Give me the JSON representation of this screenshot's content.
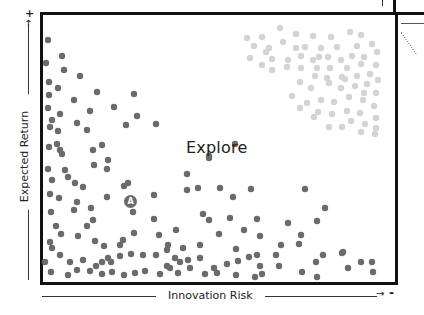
{
  "chart_data": {
    "type": "scatter",
    "title": "",
    "xlabel": "Innovation Risk",
    "ylabel": "Expected Return",
    "x_axis_end_symbol": "-",
    "y_axis_end_symbol": "+",
    "annotation": "Explore",
    "marker_label": "A",
    "grid": false,
    "colors": {
      "primary_dots": "#6b6b6b",
      "faded_dots": "#d4d4d4",
      "frame": "#111111",
      "text": "#222222"
    },
    "series": [
      {
        "name": "primary",
        "points": [
          [
            48,
            40
          ],
          [
            62,
            56
          ],
          [
            46,
            63
          ],
          [
            64,
            70
          ],
          [
            80,
            76
          ],
          [
            49,
            82
          ],
          [
            58,
            88
          ],
          [
            97,
            92
          ],
          [
            49,
            95
          ],
          [
            74,
            100
          ],
          [
            134,
            94
          ],
          [
            48,
            108
          ],
          [
            60,
            114
          ],
          [
            90,
            111
          ],
          [
            114,
            107
          ],
          [
            137,
            116
          ],
          [
            52,
            120
          ],
          [
            77,
            123
          ],
          [
            50,
            127
          ],
          [
            58,
            131
          ],
          [
            87,
            130
          ],
          [
            57,
            144
          ],
          [
            60,
            150
          ],
          [
            102,
            145
          ],
          [
            126,
            125
          ],
          [
            156,
            124
          ],
          [
            49,
            147
          ],
          [
            62,
            154
          ],
          [
            93,
            150
          ],
          [
            108,
            160
          ],
          [
            48,
            169
          ],
          [
            65,
            170
          ],
          [
            94,
            165
          ],
          [
            107,
            169
          ],
          [
            128,
            183
          ],
          [
            68,
            177
          ],
          [
            52,
            180
          ],
          [
            75,
            183
          ],
          [
            83,
            187
          ],
          [
            50,
            194
          ],
          [
            124,
            186
          ],
          [
            154,
            195
          ],
          [
            107,
            197
          ],
          [
            59,
            198
          ],
          [
            77,
            202
          ],
          [
            74,
            210
          ],
          [
            91,
            208
          ],
          [
            51,
            212
          ],
          [
            133,
            212
          ],
          [
            154,
            219
          ],
          [
            56,
            226
          ],
          [
            93,
            220
          ],
          [
            61,
            234
          ],
          [
            78,
            236
          ],
          [
            87,
            226
          ],
          [
            50,
            242
          ],
          [
            95,
            241
          ],
          [
            52,
            248
          ],
          [
            123,
            240
          ],
          [
            134,
            233
          ],
          [
            120,
            245
          ],
          [
            104,
            246
          ],
          [
            159,
            235
          ],
          [
            176,
            230
          ],
          [
            187,
            174
          ],
          [
            209,
            158
          ],
          [
            235,
            144
          ],
          [
            251,
            189
          ],
          [
            187,
            190
          ],
          [
            198,
            188
          ],
          [
            220,
            188
          ],
          [
            233,
            197
          ],
          [
            203,
            214
          ],
          [
            209,
            220
          ],
          [
            230,
            218
          ],
          [
            257,
            219
          ],
          [
            209,
            156
          ],
          [
            219,
            234
          ],
          [
            244,
            230
          ],
          [
            260,
            236
          ],
          [
            168,
            245
          ],
          [
            183,
            248
          ],
          [
            200,
            245
          ],
          [
            156,
            255
          ],
          [
            167,
            250
          ],
          [
            175,
            258
          ],
          [
            143,
            255
          ],
          [
            131,
            254
          ],
          [
            120,
            256
          ],
          [
            108,
            258
          ],
          [
            102,
            262
          ],
          [
            60,
            255
          ],
          [
            70,
            262
          ],
          [
            83,
            260
          ],
          [
            96,
            266
          ],
          [
            111,
            262
          ],
          [
            45,
            262
          ],
          [
            51,
            272
          ],
          [
            68,
            275
          ],
          [
            77,
            270
          ],
          [
            90,
            271
          ],
          [
            102,
            274
          ],
          [
            112,
            272
          ],
          [
            124,
            275
          ],
          [
            135,
            273
          ],
          [
            145,
            271
          ],
          [
            160,
            274
          ],
          [
            170,
            268
          ],
          [
            180,
            262
          ],
          [
            188,
            260
          ],
          [
            200,
            258
          ],
          [
            214,
            268
          ],
          [
            227,
            264
          ],
          [
            238,
            261
          ],
          [
            249,
            257
          ],
          [
            262,
            274
          ],
          [
            217,
            273
          ],
          [
            205,
            274
          ],
          [
            190,
            268
          ],
          [
            178,
            273
          ],
          [
            167,
            266
          ],
          [
            305,
            189
          ],
          [
            317,
            221
          ],
          [
            301,
            235
          ],
          [
            299,
            244
          ],
          [
            323,
            255
          ],
          [
            316,
            262
          ],
          [
            343,
            252
          ],
          [
            361,
            262
          ],
          [
            302,
            272
          ],
          [
            317,
            277
          ],
          [
            348,
            268
          ],
          [
            372,
            262
          ],
          [
            373,
            272
          ],
          [
            276,
            255
          ],
          [
            279,
            266
          ],
          [
            281,
            245
          ],
          [
            260,
            266
          ],
          [
            255,
            277
          ],
          [
            236,
            275
          ],
          [
            236,
            249
          ],
          [
            342,
            253
          ],
          [
            288,
            223
          ],
          [
            325,
            208
          ],
          [
            257,
            255
          ]
        ]
      },
      {
        "name": "faded",
        "points": [
          [
            280,
            28
          ],
          [
            296,
            34
          ],
          [
            247,
            38
          ],
          [
            262,
            37
          ],
          [
            313,
            36
          ],
          [
            331,
            37
          ],
          [
            350,
            32
          ],
          [
            361,
            35
          ],
          [
            321,
            48
          ],
          [
            337,
            47
          ],
          [
            357,
            46
          ],
          [
            372,
            44
          ],
          [
            254,
            46
          ],
          [
            269,
            48
          ],
          [
            283,
            42
          ],
          [
            296,
            48
          ],
          [
            305,
            47
          ],
          [
            319,
            57
          ],
          [
            352,
            56
          ],
          [
            266,
            52
          ],
          [
            250,
            58
          ],
          [
            272,
            59
          ],
          [
            288,
            60
          ],
          [
            301,
            56
          ],
          [
            313,
            60
          ],
          [
            328,
            57
          ],
          [
            341,
            60
          ],
          [
            364,
            57
          ],
          [
            377,
            52
          ],
          [
            376,
            65
          ],
          [
            361,
            64
          ],
          [
            347,
            68
          ],
          [
            330,
            68
          ],
          [
            317,
            68
          ],
          [
            301,
            68
          ],
          [
            287,
            67
          ],
          [
            272,
            70
          ],
          [
            262,
            65
          ],
          [
            315,
            76
          ],
          [
            327,
            78
          ],
          [
            342,
            77
          ],
          [
            357,
            76
          ],
          [
            370,
            74
          ],
          [
            378,
            80
          ],
          [
            300,
            82
          ],
          [
            311,
            88
          ],
          [
            329,
            83
          ],
          [
            341,
            88
          ],
          [
            355,
            86
          ],
          [
            364,
            93
          ],
          [
            376,
            93
          ],
          [
            307,
            103
          ],
          [
            321,
            100
          ],
          [
            334,
            102
          ],
          [
            349,
            97
          ],
          [
            363,
            100
          ],
          [
            374,
            106
          ],
          [
            292,
            96
          ],
          [
            300,
            108
          ],
          [
            318,
            112
          ],
          [
            332,
            114
          ],
          [
            347,
            111
          ],
          [
            360,
            113
          ],
          [
            376,
            118
          ],
          [
            351,
            121
          ],
          [
            365,
            124
          ],
          [
            376,
            128
          ],
          [
            361,
            132
          ],
          [
            375,
            134
          ],
          [
            342,
            127
          ],
          [
            329,
            127
          ],
          [
            314,
            117
          ],
          [
            367,
            84
          ],
          [
            345,
            79
          ]
        ]
      }
    ],
    "marker": {
      "label": "A",
      "x": 130,
      "y": 201
    },
    "layout_hints": {
      "frame": [
        40,
        12,
        395,
        282
      ],
      "legend": "none"
    }
  },
  "labels": {
    "annotation": "Explore",
    "x_axis": "Innovation Risk",
    "y_axis": "Expected Return",
    "x_axis_end": "-",
    "y_axis_end": "+",
    "marker": "A"
  }
}
